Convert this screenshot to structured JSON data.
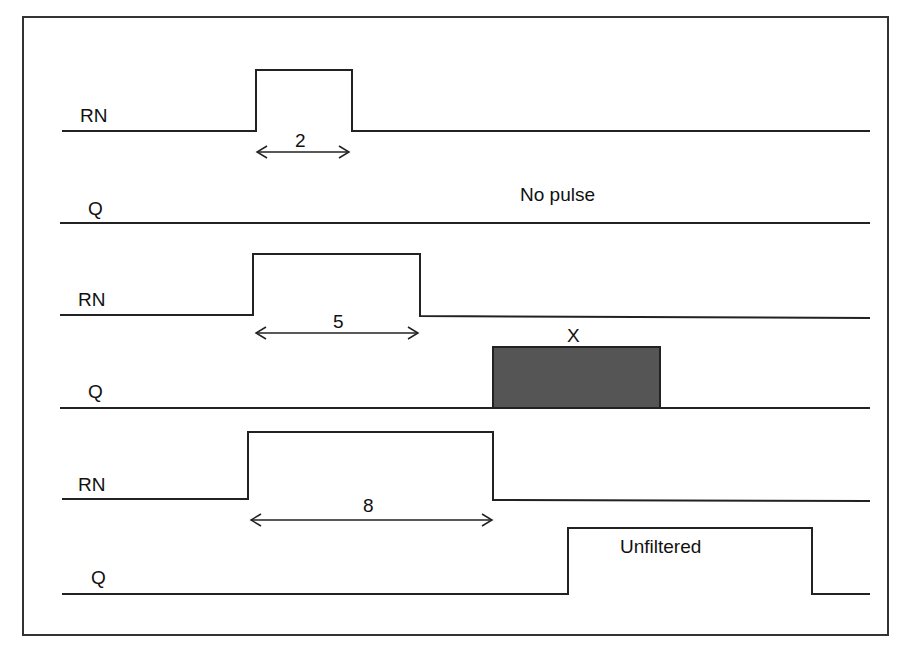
{
  "diagram": {
    "type": "timing",
    "signals": [
      {
        "label": "RN",
        "pulse_width_label": "2"
      },
      {
        "label": "Q",
        "annotation": "No pulse"
      },
      {
        "label": "RN",
        "pulse_width_label": "5"
      },
      {
        "label": "Q",
        "annotation": "X"
      },
      {
        "label": "RN",
        "pulse_width_label": "8"
      },
      {
        "label": "Q",
        "annotation": "Unfiltered"
      }
    ],
    "colors": {
      "line": "#222222",
      "x_fill": "#555555",
      "frame": "#333333"
    }
  }
}
